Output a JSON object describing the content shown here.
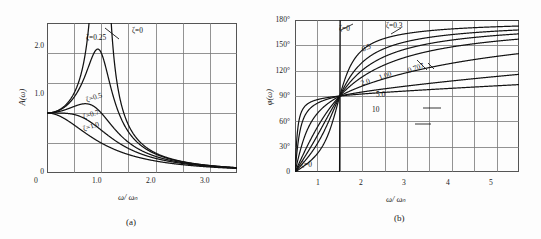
{
  "figure": {
    "panels": [
      {
        "id": "a",
        "caption": "(a)",
        "xlabel": "ω/ ωₙ",
        "ylabel": "A(ω)",
        "xticks": [
          "0",
          "1.0",
          "2.0",
          "3.0"
        ],
        "yticks": [
          "0",
          "1.0",
          "2.0"
        ],
        "curve_labels": [
          {
            "text": "ζ=0.25"
          },
          {
            "text": "ζ=0"
          },
          {
            "text": "ζ=0.5"
          },
          {
            "text": "ζ=0.7"
          },
          {
            "text": "ζ=1.0"
          }
        ]
      },
      {
        "id": "b",
        "caption": "(b)",
        "xlabel": "ω/ ωₙ",
        "ylabel": "φ(ω)",
        "xticks": [
          "0",
          "1",
          "2",
          "3",
          "4",
          "5"
        ],
        "yticks": [
          "0",
          "30°",
          "60°",
          "90°",
          "120°",
          "150°",
          "180°"
        ],
        "curve_labels": [
          {
            "text": "ζ=0"
          },
          {
            "text": "ζ=0.3"
          },
          {
            "text": "0.5"
          },
          {
            "text": "0.707"
          },
          {
            "text": "1.00"
          },
          {
            "text": "2.0"
          },
          {
            "text": "5.0"
          },
          {
            "text": "10"
          },
          {
            "text": "ζ=0"
          }
        ]
      }
    ]
  },
  "chart_data": [
    {
      "type": "line",
      "title": "",
      "panel": "(a)",
      "xlabel": "ω/ωₙ",
      "ylabel": "A(ω)",
      "xlim": [
        0,
        3.5
      ],
      "ylim": [
        0,
        2.5
      ],
      "xticks": [
        0,
        1.0,
        2.0,
        3.0
      ],
      "yticks": [
        0,
        1.0,
        2.0
      ],
      "grid": true,
      "legend": "inline-annotations",
      "x": [
        0,
        0.1,
        0.2,
        0.3,
        0.4,
        0.5,
        0.6,
        0.7,
        0.8,
        0.9,
        0.95,
        1.0,
        1.05,
        1.1,
        1.2,
        1.3,
        1.4,
        1.5,
        1.75,
        2.0,
        2.25,
        2.5,
        2.75,
        3.0,
        3.25,
        3.5
      ],
      "series": [
        {
          "name": "ζ=0",
          "zeta": 0,
          "values": [
            1.0,
            1.01,
            1.04,
            1.1,
            1.19,
            1.33,
            1.56,
            1.96,
            2.78,
            5.26,
            10.26,
            99.0,
            9.76,
            4.76,
            2.27,
            1.45,
            1.04,
            0.8,
            0.49,
            0.33,
            0.25,
            0.19,
            0.15,
            0.125,
            0.105,
            0.089
          ]
        },
        {
          "name": "ζ=0.25",
          "zeta": 0.25,
          "values": [
            1.0,
            1.01,
            1.04,
            1.1,
            1.18,
            1.31,
            1.5,
            1.79,
            2.16,
            2.42,
            2.39,
            2.0,
            1.94,
            1.72,
            1.32,
            1.03,
            0.83,
            0.68,
            0.45,
            0.32,
            0.24,
            0.18,
            0.15,
            0.12,
            0.104,
            0.088
          ]
        },
        {
          "name": "ζ=0.5",
          "zeta": 0.5,
          "values": [
            1.0,
            1.0,
            1.02,
            1.05,
            1.09,
            1.13,
            1.16,
            1.17,
            1.15,
            1.1,
            1.07,
            1.0,
            0.96,
            0.91,
            0.81,
            0.71,
            0.62,
            0.55,
            0.41,
            0.3,
            0.23,
            0.18,
            0.145,
            0.12,
            0.101,
            0.086
          ]
        },
        {
          "name": "ζ=0.7",
          "zeta": 0.7,
          "values": [
            1.0,
            1.0,
            1.0,
            1.0,
            1.0,
            0.99,
            0.98,
            0.95,
            0.91,
            0.85,
            0.82,
            0.714,
            0.75,
            0.71,
            0.65,
            0.59,
            0.53,
            0.48,
            0.37,
            0.28,
            0.22,
            0.175,
            0.14,
            0.117,
            0.099,
            0.085
          ]
        },
        {
          "name": "ζ=1.0",
          "zeta": 1.0,
          "values": [
            1.0,
            0.99,
            0.96,
            0.92,
            0.86,
            0.8,
            0.74,
            0.67,
            0.61,
            0.55,
            0.53,
            0.5,
            0.475,
            0.45,
            0.41,
            0.37,
            0.33,
            0.31,
            0.25,
            0.2,
            0.165,
            0.138,
            0.116,
            0.1,
            0.086,
            0.075
          ]
        }
      ],
      "note": "Normalized magnitude response of a second-order system; plotted y-axis shows A(ω) relative to static gain, curves for damping ratios 0, 0.25, 0.5, 0.7, 1.0"
    },
    {
      "type": "line",
      "title": "",
      "panel": "(b)",
      "xlabel": "ω/ωₙ",
      "ylabel": "φ(ω)",
      "xlim": [
        0,
        5
      ],
      "ylim": [
        0,
        180
      ],
      "xticks": [
        0,
        1,
        2,
        3,
        4,
        5
      ],
      "yticks": [
        0,
        30,
        60,
        90,
        120,
        150,
        180
      ],
      "yunit": "degrees",
      "grid": true,
      "legend": "inline-annotations",
      "x": [
        0,
        0.1,
        0.2,
        0.3,
        0.4,
        0.5,
        0.6,
        0.7,
        0.8,
        0.9,
        1.0,
        1.1,
        1.2,
        1.3,
        1.5,
        1.75,
        2.0,
        2.5,
        3.0,
        3.5,
        4.0,
        4.5,
        5.0
      ],
      "series": [
        {
          "name": "ζ=0",
          "zeta": 0,
          "values": [
            0,
            0,
            0,
            0,
            0,
            0,
            0,
            0,
            0,
            0,
            90,
            180,
            180,
            180,
            180,
            180,
            180,
            180,
            180,
            180,
            180,
            180,
            180
          ]
        },
        {
          "name": "ζ=0.3",
          "zeta": 0.3,
          "values": [
            0,
            3.5,
            7.1,
            11.2,
            16.1,
            21.8,
            28.8,
            37.5,
            48.2,
            61.4,
            90,
            117,
            135,
            146,
            158,
            165,
            169,
            173,
            175,
            176,
            177,
            177,
            177
          ]
        },
        {
          "name": "0.5",
          "zeta": 0.5,
          "values": [
            0,
            5.8,
            11.8,
            18.2,
            25.2,
            33.7,
            43.2,
            54.6,
            68.0,
            82.1,
            90,
            108,
            121,
            131,
            144,
            154,
            160,
            167,
            170,
            172,
            174,
            175,
            176
          ]
        },
        {
          "name": "0.707",
          "zeta": 0.707,
          "values": [
            0,
            8.2,
            16.6,
            25.4,
            34.8,
            44.9,
            55.6,
            66.6,
            77.4,
            86.6,
            90,
            103,
            112,
            120,
            132,
            142,
            149,
            159,
            164,
            167,
            170,
            171,
            173
          ]
        },
        {
          "name": "1.00",
          "zeta": 1.0,
          "values": [
            0,
            11.5,
            23.2,
            35.0,
            47.0,
            58.1,
            68.0,
            76.6,
            83.8,
            87.6,
            90,
            99,
            107,
            114,
            126,
            136,
            143,
            155,
            161,
            165,
            168,
            170,
            171
          ]
        },
        {
          "name": "2.0",
          "zeta": 2.0,
          "values": [
            0,
            22.1,
            39.8,
            52.8,
            62.1,
            69.0,
            74.2,
            78.2,
            81.4,
            85.0,
            90,
            95,
            99,
            103,
            110,
            118,
            124,
            135,
            142,
            148,
            152,
            155,
            158
          ]
        },
        {
          "name": "5.0",
          "zeta": 5.0,
          "values": [
            0,
            45.0,
            64.0,
            73.3,
            78.6,
            82.0,
            84.4,
            86.2,
            87.7,
            88.9,
            90,
            92,
            94,
            96,
            100,
            104,
            108,
            116,
            122,
            128,
            132,
            137,
            141
          ]
        },
        {
          "name": "10",
          "zeta": 10.0,
          "values": [
            0,
            63.4,
            76.0,
            81.2,
            84.0,
            85.7,
            86.9,
            87.8,
            88.5,
            89.3,
            90,
            91,
            92,
            93,
            95.5,
            98,
            101,
            106,
            111,
            115,
            119,
            123,
            127
          ]
        }
      ],
      "note": "Phase response of a second-order system in degrees; all curves pass through 90° at ω/ωₙ = 1"
    }
  ]
}
